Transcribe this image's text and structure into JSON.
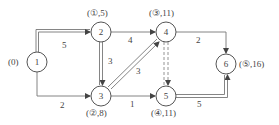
{
  "nodes": [
    {
      "id": "1",
      "label": "1",
      "x": 37,
      "y": 62,
      "annotation": "(0)"
    },
    {
      "id": "2",
      "label": "2",
      "x": 101,
      "y": 32,
      "annotation": "(①,5)"
    },
    {
      "id": "3",
      "label": "3",
      "x": 101,
      "y": 96,
      "annotation": "(②,8)"
    },
    {
      "id": "4",
      "label": "4",
      "x": 166,
      "y": 32,
      "annotation": "(③,11)"
    },
    {
      "id": "5",
      "label": "5",
      "x": 166,
      "y": 96,
      "annotation": "(④,11)"
    },
    {
      "id": "6",
      "label": "6",
      "x": 226,
      "y": 64,
      "annotation": "(⑤,16)"
    }
  ],
  "edges": [
    {
      "from": "1",
      "to": "2",
      "weight": "5",
      "style": "double"
    },
    {
      "from": "1",
      "to": "3",
      "weight": "2",
      "style": "single"
    },
    {
      "from": "2",
      "to": "4",
      "weight": "4",
      "style": "single"
    },
    {
      "from": "2",
      "to": "3",
      "weight": "3",
      "style": "double"
    },
    {
      "from": "3",
      "to": "4",
      "weight": "3",
      "style": "double"
    },
    {
      "from": "3",
      "to": "5",
      "weight": "1",
      "style": "single"
    },
    {
      "from": "4",
      "to": "5",
      "weight": "",
      "style": "double-dashed"
    },
    {
      "from": "4",
      "to": "6",
      "weight": "2",
      "style": "single"
    },
    {
      "from": "5",
      "to": "6",
      "weight": "5",
      "style": "double"
    }
  ]
}
